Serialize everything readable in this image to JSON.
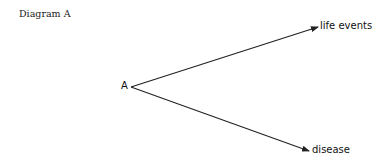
{
  "diagram": {
    "title": "Diagram A",
    "nodes": {
      "source": "A",
      "target_top": "life events",
      "target_bottom": "disease"
    },
    "edges": [
      {
        "from": "A",
        "to": "life events"
      },
      {
        "from": "A",
        "to": "disease"
      }
    ],
    "line_color": "#222222"
  }
}
